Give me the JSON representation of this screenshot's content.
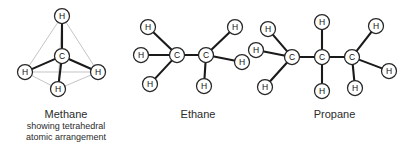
{
  "figure": {
    "background_color": "#ffffff",
    "bond_color": "#1a1a1a",
    "outline_color": "#b9b9b9",
    "atom_outline_color": "#262626",
    "text_color": "#2b2b2b"
  },
  "molecules": [
    {
      "id": "methane",
      "name": "Methane",
      "caption_title": "Methane",
      "caption_line_1": "showing tetrahedral",
      "caption_line_2": "atomic arrangement",
      "formula": "CH4",
      "carbon_count": 1,
      "hydrogen_count": 4,
      "geometry": "tetrahedral",
      "atoms": [
        {
          "element": "C",
          "label": "C",
          "x": 62,
          "y": 56,
          "r": 7.5
        },
        {
          "element": "H",
          "label": "H",
          "x": 62,
          "y": 16,
          "r": 7.5
        },
        {
          "element": "H",
          "label": "H",
          "x": 25,
          "y": 72,
          "r": 7.5
        },
        {
          "element": "H",
          "label": "H",
          "x": 98,
          "y": 72,
          "r": 7.5
        },
        {
          "element": "H",
          "label": "H",
          "x": 58,
          "y": 89,
          "r": 7.5
        }
      ],
      "bonds": [
        {
          "from": 0,
          "to": 1
        },
        {
          "from": 0,
          "to": 2
        },
        {
          "from": 0,
          "to": 3
        },
        {
          "from": 0,
          "to": 4
        }
      ],
      "tetrahedron_edges": [
        {
          "from": 1,
          "to": 2
        },
        {
          "from": 1,
          "to": 3
        },
        {
          "from": 1,
          "to": 4
        },
        {
          "from": 2,
          "to": 3
        },
        {
          "from": 2,
          "to": 4
        },
        {
          "from": 3,
          "to": 4
        }
      ]
    },
    {
      "id": "ethane",
      "name": "Ethane",
      "caption_title": "Ethane",
      "formula": "C2H6",
      "carbon_count": 2,
      "hydrogen_count": 6,
      "geometry": "planar projection",
      "atoms": [
        {
          "element": "C",
          "label": "C",
          "x": 177,
          "y": 55,
          "r": 7.5
        },
        {
          "element": "C",
          "label": "C",
          "x": 206,
          "y": 55,
          "r": 7.5
        },
        {
          "element": "H",
          "label": "H",
          "x": 148,
          "y": 27,
          "r": 7.5
        },
        {
          "element": "H",
          "label": "H",
          "x": 141,
          "y": 55,
          "r": 7.5
        },
        {
          "element": "H",
          "label": "H",
          "x": 150,
          "y": 84,
          "r": 7.5
        },
        {
          "element": "H",
          "label": "H",
          "x": 235,
          "y": 27,
          "r": 7.5
        },
        {
          "element": "H",
          "label": "H",
          "x": 242,
          "y": 62,
          "r": 7.5
        },
        {
          "element": "H",
          "label": "H",
          "x": 204,
          "y": 86,
          "r": 7.5
        }
      ],
      "bonds": [
        {
          "from": 0,
          "to": 1
        },
        {
          "from": 0,
          "to": 2
        },
        {
          "from": 0,
          "to": 3
        },
        {
          "from": 0,
          "to": 4
        },
        {
          "from": 1,
          "to": 5
        },
        {
          "from": 1,
          "to": 6
        },
        {
          "from": 1,
          "to": 7
        }
      ]
    },
    {
      "id": "propane",
      "name": "Propane",
      "caption_title": "Propane",
      "formula": "C3H8",
      "carbon_count": 3,
      "hydrogen_count": 8,
      "geometry": "planar projection",
      "atoms": [
        {
          "element": "C",
          "label": "C",
          "x": 292,
          "y": 57,
          "r": 7.5
        },
        {
          "element": "C",
          "label": "C",
          "x": 322,
          "y": 57,
          "r": 7.5
        },
        {
          "element": "C",
          "label": "C",
          "x": 352,
          "y": 57,
          "r": 7.5
        },
        {
          "element": "H",
          "label": "H",
          "x": 268,
          "y": 29,
          "r": 7.5
        },
        {
          "element": "H",
          "label": "H",
          "x": 256,
          "y": 50,
          "r": 7.5
        },
        {
          "element": "H",
          "label": "H",
          "x": 265,
          "y": 87,
          "r": 7.5
        },
        {
          "element": "H",
          "label": "H",
          "x": 322,
          "y": 22,
          "r": 7.5
        },
        {
          "element": "H",
          "label": "H",
          "x": 322,
          "y": 91,
          "r": 7.5
        },
        {
          "element": "H",
          "label": "H",
          "x": 376,
          "y": 26,
          "r": 7.5
        },
        {
          "element": "H",
          "label": "H",
          "x": 389,
          "y": 71,
          "r": 7.5
        },
        {
          "element": "H",
          "label": "H",
          "x": 355,
          "y": 88,
          "r": 7.5
        }
      ],
      "bonds": [
        {
          "from": 0,
          "to": 1
        },
        {
          "from": 1,
          "to": 2
        },
        {
          "from": 0,
          "to": 3
        },
        {
          "from": 0,
          "to": 4
        },
        {
          "from": 0,
          "to": 5
        },
        {
          "from": 1,
          "to": 6
        },
        {
          "from": 1,
          "to": 7
        },
        {
          "from": 2,
          "to": 8
        },
        {
          "from": 2,
          "to": 9
        },
        {
          "from": 2,
          "to": 10
        }
      ]
    }
  ]
}
